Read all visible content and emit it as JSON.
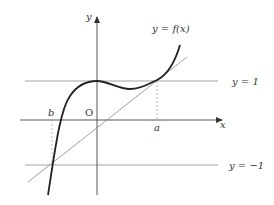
{
  "diagram": {
    "title": "y = f(x)",
    "labels": {
      "y_axis": "y",
      "x_axis": "x",
      "origin": "O",
      "curve": "y = f(x)",
      "line_upper": "y = 1",
      "line_lower": "y = −1",
      "point_a": "a",
      "point_b": "b"
    },
    "elements": [
      {
        "type": "axis",
        "name": "x-axis",
        "direction": "horizontal"
      },
      {
        "type": "axis",
        "name": "y-axis",
        "direction": "vertical"
      },
      {
        "type": "curve",
        "name": "cubic f(x)",
        "features": [
          "local max on y-axis at y=1",
          "local min between 0 and a",
          "tangent to y=1 at x=0",
          "crosses y=1 at x=a",
          "passes through y=-1 at x=b"
        ]
      },
      {
        "type": "line",
        "name": "y = 1"
      },
      {
        "type": "line",
        "name": "y = -1"
      },
      {
        "type": "line",
        "name": "tangent line through (b,-1) and (a,1)"
      },
      {
        "type": "dashed",
        "name": "projection from (a,1) to x-axis"
      },
      {
        "type": "dashed",
        "name": "projection from x-axis at b to (b,-1)"
      }
    ],
    "colors": {
      "curve": "#222222",
      "axis": "#555555",
      "guide": "#999999",
      "text": "#333333"
    }
  }
}
